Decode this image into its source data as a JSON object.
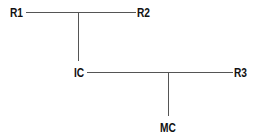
{
  "diagram": {
    "type": "tree",
    "nodes": [
      {
        "id": "R1",
        "label": "R1"
      },
      {
        "id": "R2",
        "label": "R2"
      },
      {
        "id": "IC",
        "label": "IC"
      },
      {
        "id": "R3",
        "label": "R3"
      },
      {
        "id": "MC",
        "label": "MC"
      }
    ],
    "edges": [
      {
        "from": "R1",
        "to": "R2"
      },
      {
        "from": "R1-R2",
        "to": "IC"
      },
      {
        "from": "IC",
        "to": "R3"
      },
      {
        "from": "IC-R3",
        "to": "MC"
      }
    ],
    "colors": {
      "line": "#555555",
      "text": "#111111",
      "background": "#ffffff"
    }
  }
}
